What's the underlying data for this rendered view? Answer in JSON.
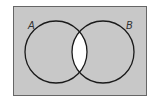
{
  "diagram": {
    "type": "venn",
    "sets": [
      {
        "label": "A"
      },
      {
        "label": "B"
      }
    ],
    "shaded_region": "complement of A ∩ B",
    "unshaded_region": "A ∩ B",
    "colors": {
      "shade": "#c8c8c8",
      "unshaded": "#ffffff",
      "stroke": "#1a1a1a",
      "border": "#666666"
    }
  }
}
